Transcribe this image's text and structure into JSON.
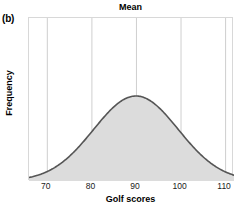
{
  "figure": {
    "panel_label": "(b)",
    "title": "Mean",
    "x_axis_label": "Golf scores",
    "y_axis_label": "Frequency"
  },
  "colors": {
    "curve_stroke": "#555555",
    "curve_fill": "#dcdcdc",
    "gridline": "#cfcfcf",
    "plot_border": "#d8d8d8",
    "background": "#ffffff",
    "text": "#000000"
  },
  "chart_data": {
    "type": "area",
    "title": "Mean",
    "xlabel": "Golf scores",
    "ylabel": "Frequency",
    "xlim": [
      66,
      112
    ],
    "ylim": [
      0,
      1
    ],
    "xticks": [
      70,
      80,
      90,
      100,
      110
    ],
    "xtick_labels": [
      "70",
      "80",
      "90",
      "100",
      "110"
    ],
    "ytick_labels": [],
    "grid": "vertical",
    "legend": null,
    "annotations": [
      {
        "text": "Mean",
        "x": 90,
        "note": "title placed above the distribution peak marking the mean"
      },
      {
        "text": "(b)",
        "note": "panel identifier at top-left of figure"
      }
    ],
    "distribution": {
      "shape": "normal",
      "mean": 90,
      "std": 9.5,
      "peak_x": 90,
      "peak_y": 1.0,
      "symmetric": true,
      "description": "Symmetric bell-shaped normal curve of golf scores centered on the mean of 90, shaded light gray beneath the curve."
    },
    "x": [
      66,
      68,
      70,
      72,
      74,
      76,
      78,
      80,
      82,
      84,
      86,
      88,
      90,
      92,
      94,
      96,
      98,
      100,
      102,
      104,
      106,
      108,
      110,
      112
    ],
    "values": [
      0.014,
      0.027,
      0.05,
      0.087,
      0.143,
      0.221,
      0.323,
      0.442,
      0.566,
      0.684,
      0.81,
      0.931,
      1.0,
      0.931,
      0.81,
      0.684,
      0.566,
      0.442,
      0.323,
      0.221,
      0.143,
      0.087,
      0.05,
      0.027
    ]
  }
}
